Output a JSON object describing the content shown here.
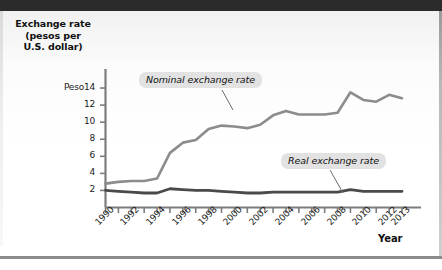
{
  "figure": {
    "y_axis_title": "Exchange rate\n(pesos per\nU.S. dollar)",
    "y_axis_title_line1": "Exchange rate",
    "y_axis_title_line2": "(pesos per",
    "y_axis_title_line3": "U.S. dollar)",
    "x_axis_title": "Year",
    "peso_prefix": "Peso"
  },
  "callouts": {
    "nominal": "Nominal exchange rate",
    "real": "Real exchange rate"
  },
  "colors": {
    "nominal_line": "#8c8c8c",
    "real_line": "#4a4a4a",
    "axis": "#7d7d7d",
    "callout_bg": "#e2e2e2",
    "text": "#111111",
    "top_bar": "#2b2b2b"
  },
  "chart_data": {
    "type": "line",
    "title": "",
    "xlabel": "Year",
    "ylabel": "Exchange rate (pesos per U.S. dollar)",
    "ylim": [
      0,
      15
    ],
    "xlim": [
      1990,
      2013
    ],
    "grid": false,
    "legend": "callout-labels",
    "ytick_labels": [
      "Peso14",
      "12",
      "10",
      "8",
      "6",
      "4",
      "2"
    ],
    "ytick_values": [
      14,
      12,
      10,
      8,
      6,
      4,
      2
    ],
    "xtick_labels": [
      "1990",
      "1992",
      "1994",
      "1996",
      "1998",
      "2000",
      "2002",
      "2004",
      "2006",
      "2008",
      "2010",
      "2012",
      "2013"
    ],
    "xtick_values": [
      1990,
      1992,
      1994,
      1996,
      1998,
      2000,
      2002,
      2004,
      2006,
      2008,
      2010,
      2012,
      2013
    ],
    "x": [
      1990,
      1991,
      1992,
      1993,
      1994,
      1995,
      1996,
      1997,
      1998,
      1999,
      2000,
      2001,
      2002,
      2003,
      2004,
      2005,
      2006,
      2007,
      2008,
      2009,
      2010,
      2011,
      2012,
      2013
    ],
    "series": [
      {
        "name": "Nominal exchange rate",
        "color": "#8c8c8c",
        "values": [
          2.8,
          3.0,
          3.1,
          3.1,
          3.4,
          6.4,
          7.6,
          7.9,
          9.2,
          9.6,
          9.5,
          9.3,
          9.7,
          10.8,
          11.3,
          10.9,
          10.9,
          10.9,
          11.1,
          13.5,
          12.6,
          12.4,
          13.2,
          12.8
        ]
      },
      {
        "name": "Real exchange rate",
        "color": "#4a4a4a",
        "values": [
          2.0,
          1.9,
          1.8,
          1.7,
          1.7,
          2.2,
          2.1,
          2.0,
          2.0,
          1.9,
          1.8,
          1.7,
          1.7,
          1.8,
          1.8,
          1.8,
          1.8,
          1.8,
          1.8,
          2.1,
          1.9,
          1.9,
          1.9,
          1.9
        ]
      }
    ]
  }
}
